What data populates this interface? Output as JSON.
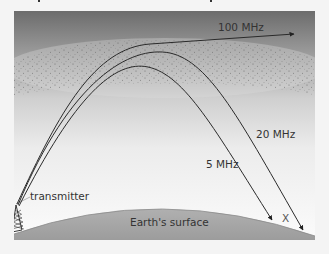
{
  "diagram": {
    "labels": {
      "freq_high": "100 MHz",
      "freq_mid": "20 MHz",
      "freq_low": "5 MHz",
      "transmitter": "transmitter",
      "surface": "Earth's surface",
      "distance_marker": "X"
    },
    "colors": {
      "sky_top": "#6e6e6e",
      "sky_bottom": "#fafafa",
      "ground": "#a4a4a4",
      "ray": "#2a2a2a",
      "ionosphere_dots": "#5a5a5a"
    },
    "rays": [
      {
        "name": "100 MHz",
        "behaviour": "escapes ionosphere"
      },
      {
        "name": "20 MHz",
        "behaviour": "refracted back to Earth, lands farther"
      },
      {
        "name": "5 MHz",
        "behaviour": "refracted back to Earth, lands nearer"
      }
    ]
  }
}
